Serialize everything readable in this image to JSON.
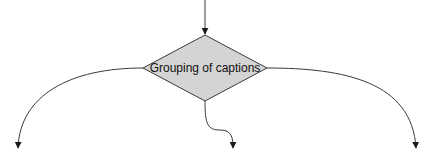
{
  "diagram": {
    "decision_node": {
      "label": "Grouping of captions",
      "shape": "diamond",
      "fill": "#d4d4d4",
      "stroke": "#3a3a3a"
    },
    "edges": [
      {
        "name": "incoming",
        "from": "top",
        "to": "decision_node"
      },
      {
        "name": "left-branch",
        "from": "decision_node",
        "to": "bottom-left"
      },
      {
        "name": "middle-branch",
        "from": "decision_node",
        "to": "bottom-center"
      },
      {
        "name": "right-branch",
        "from": "decision_node",
        "to": "bottom-right"
      }
    ],
    "colors": {
      "line": "#3a3a3a",
      "background": "#ffffff"
    }
  }
}
